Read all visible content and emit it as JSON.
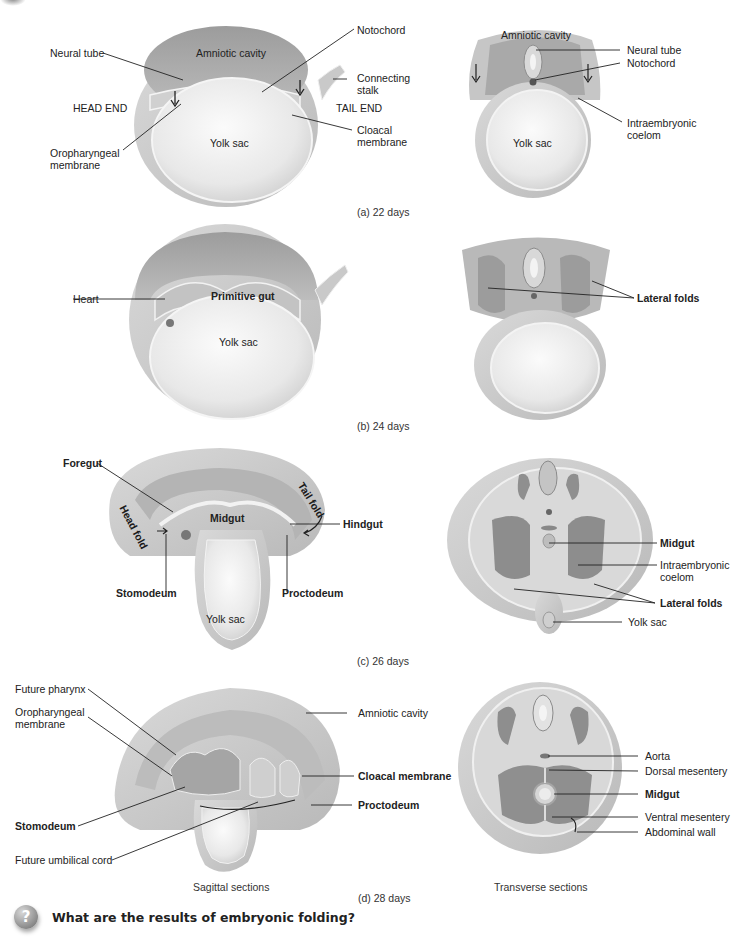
{
  "panels": {
    "a": {
      "caption": "(a) 22 days",
      "sagittal_labels": {
        "neural_tube": "Neural tube",
        "amniotic_cavity": "Amniotic cavity",
        "notochord": "Notochord",
        "connecting_stalk": "Connecting stalk",
        "head_end": "HEAD END",
        "tail_end": "TAIL END",
        "yolk_sac": "Yolk sac",
        "oropharyngeal_membrane": "Oropharyngeal membrane",
        "cloacal_membrane": "Cloacal membrane"
      },
      "transverse_labels": {
        "amniotic_cavity": "Amniotic cavity",
        "neural_tube": "Neural tube",
        "notochord": "Notochord",
        "intraembryonic_coelom": "Intraembryonic coelom",
        "yolk_sac": "Yolk sac"
      }
    },
    "b": {
      "caption": "(b) 24 days",
      "sagittal_labels": {
        "heart": "Heart",
        "primitive_gut": "Primitive gut",
        "yolk_sac": "Yolk sac"
      },
      "transverse_labels": {
        "lateral_folds": "Lateral folds"
      }
    },
    "c": {
      "caption": "(c) 26 days",
      "sagittal_labels": {
        "foregut": "Foregut",
        "head_fold": "Head fold",
        "midgut": "Midgut",
        "tail_fold": "Tail fold",
        "hindgut": "Hindgut",
        "stomodeum": "Stomodeum",
        "proctodeum": "Proctodeum",
        "yolk_sac": "Yolk sac"
      },
      "transverse_labels": {
        "midgut": "Midgut",
        "intraembryonic_coelom": "Intraembryonic coelom",
        "lateral_folds": "Lateral folds",
        "yolk_sac": "Yolk sac"
      }
    },
    "d": {
      "caption": "(d) 28 days",
      "sagittal_labels": {
        "future_pharynx": "Future pharynx",
        "oropharyngeal_membrane": "Oropharyngeal membrane",
        "amniotic_cavity": "Amniotic cavity",
        "cloacal_membrane": "Cloacal membrane",
        "proctodeum": "Proctodeum",
        "stomodeum": "Stomodeum",
        "future_umbilical_cord": "Future umbilical cord"
      },
      "transverse_labels": {
        "aorta": "Aorta",
        "dorsal_mesentery": "Dorsal mesentery",
        "midgut": "Midgut",
        "ventral_mesentery": "Ventral mesentery",
        "abdominal_wall": "Abdominal wall"
      }
    }
  },
  "column_captions": {
    "sagittal": "Sagittal sections",
    "transverse": "Transverse sections"
  },
  "question": {
    "icon": "question-mark-icon",
    "text": "What are the results of embryonic folding?"
  },
  "colors": {
    "tissue_light": "#e6e6e6",
    "tissue_mid": "#c8c8c8",
    "tissue_dark": "#9a9a9a",
    "cavity": "#b4b4b4",
    "leader_line": "#222222"
  }
}
